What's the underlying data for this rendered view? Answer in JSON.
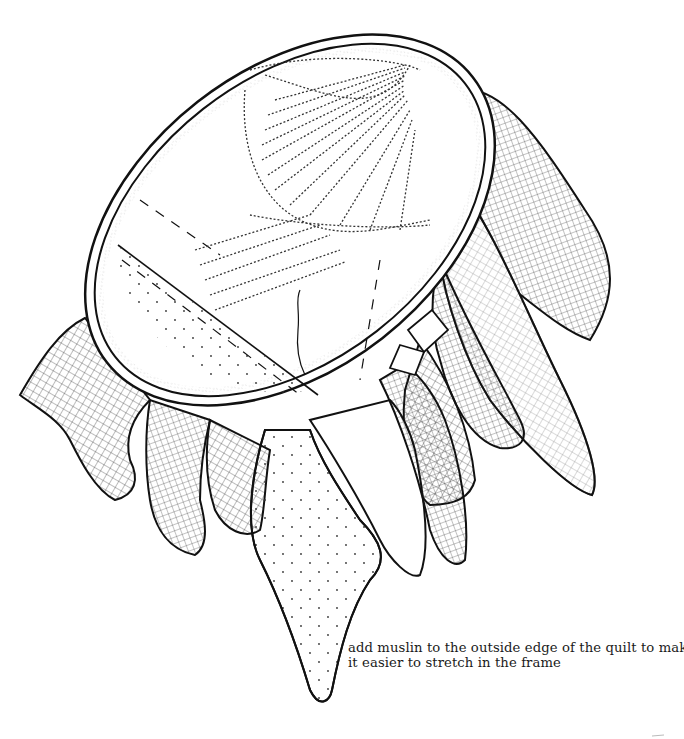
{
  "figure": {
    "caption_lines": [
      "add muslin to the outside edge of the quilt to make",
      "it easier to stretch in the frame"
    ]
  },
  "colors": {
    "ink": "#111111",
    "paper": "#ffffff"
  }
}
